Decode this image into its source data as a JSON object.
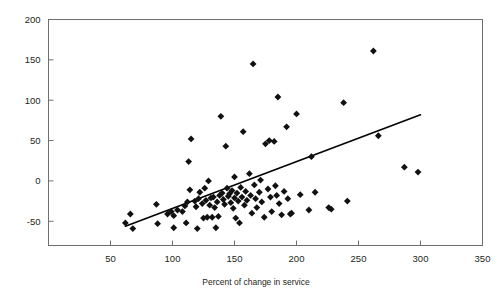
{
  "chart_data": {
    "type": "scatter",
    "title": "",
    "xlabel": "Percent of change in service",
    "ylabel": "",
    "xlim": [
      0,
      350
    ],
    "ylim": [
      -80,
      200
    ],
    "grid": false,
    "legend": "none",
    "x_ticks": [
      50,
      100,
      150,
      200,
      250,
      300,
      350
    ],
    "x_tick_labels": [
      "50",
      "100",
      "150",
      "200",
      "250",
      "300",
      "350"
    ],
    "y_ticks": [
      -50,
      0,
      50,
      100,
      150,
      200
    ],
    "y_tick_labels": [
      "-50",
      "0",
      "50",
      "100",
      "150",
      "200"
    ],
    "marker": "diamond",
    "marker_color": "#111111",
    "trendline": {
      "visible": true,
      "color": "#000000",
      "x_start": 62,
      "y_start": -56,
      "x_end": 300,
      "y_end": 82
    },
    "points": [
      {
        "x": 62,
        "y": -52
      },
      {
        "x": 66,
        "y": -41
      },
      {
        "x": 68,
        "y": -59
      },
      {
        "x": 87,
        "y": -29
      },
      {
        "x": 88,
        "y": -53
      },
      {
        "x": 96,
        "y": -41
      },
      {
        "x": 99,
        "y": -38
      },
      {
        "x": 101,
        "y": -43
      },
      {
        "x": 101,
        "y": -58
      },
      {
        "x": 104,
        "y": -36
      },
      {
        "x": 108,
        "y": -38
      },
      {
        "x": 110,
        "y": -31
      },
      {
        "x": 111,
        "y": -52
      },
      {
        "x": 112,
        "y": -26
      },
      {
        "x": 113,
        "y": 24
      },
      {
        "x": 114,
        "y": -11
      },
      {
        "x": 115,
        "y": 52
      },
      {
        "x": 118,
        "y": -25
      },
      {
        "x": 119,
        "y": -32
      },
      {
        "x": 120,
        "y": -59
      },
      {
        "x": 121,
        "y": -22
      },
      {
        "x": 122,
        "y": -14
      },
      {
        "x": 124,
        "y": -28
      },
      {
        "x": 125,
        "y": -46
      },
      {
        "x": 126,
        "y": -9
      },
      {
        "x": 127,
        "y": -24
      },
      {
        "x": 128,
        "y": -45
      },
      {
        "x": 129,
        "y": 0
      },
      {
        "x": 130,
        "y": -30
      },
      {
        "x": 131,
        "y": -21
      },
      {
        "x": 132,
        "y": -45
      },
      {
        "x": 133,
        "y": -20
      },
      {
        "x": 134,
        "y": -33
      },
      {
        "x": 135,
        "y": -58
      },
      {
        "x": 136,
        "y": -26
      },
      {
        "x": 137,
        "y": -44
      },
      {
        "x": 138,
        "y": -18
      },
      {
        "x": 139,
        "y": 80
      },
      {
        "x": 140,
        "y": -15
      },
      {
        "x": 141,
        "y": -23
      },
      {
        "x": 142,
        "y": -29
      },
      {
        "x": 143,
        "y": 43
      },
      {
        "x": 144,
        "y": -9
      },
      {
        "x": 145,
        "y": -19
      },
      {
        "x": 146,
        "y": -16
      },
      {
        "x": 147,
        "y": -27
      },
      {
        "x": 148,
        "y": -12
      },
      {
        "x": 149,
        "y": -34
      },
      {
        "x": 150,
        "y": 5
      },
      {
        "x": 150,
        "y": -21
      },
      {
        "x": 151,
        "y": -46
      },
      {
        "x": 152,
        "y": -15
      },
      {
        "x": 153,
        "y": -25
      },
      {
        "x": 154,
        "y": -52
      },
      {
        "x": 155,
        "y": -8
      },
      {
        "x": 156,
        "y": -20
      },
      {
        "x": 157,
        "y": 61
      },
      {
        "x": 158,
        "y": -30
      },
      {
        "x": 159,
        "y": -13
      },
      {
        "x": 160,
        "y": -24
      },
      {
        "x": 162,
        "y": 9
      },
      {
        "x": 163,
        "y": -18
      },
      {
        "x": 164,
        "y": -40
      },
      {
        "x": 165,
        "y": 145
      },
      {
        "x": 166,
        "y": -5
      },
      {
        "x": 167,
        "y": -22
      },
      {
        "x": 168,
        "y": -33
      },
      {
        "x": 170,
        "y": -14
      },
      {
        "x": 171,
        "y": 1
      },
      {
        "x": 172,
        "y": -26
      },
      {
        "x": 174,
        "y": -45
      },
      {
        "x": 175,
        "y": 46
      },
      {
        "x": 177,
        "y": -10
      },
      {
        "x": 178,
        "y": 50
      },
      {
        "x": 179,
        "y": -20
      },
      {
        "x": 180,
        "y": -38
      },
      {
        "x": 182,
        "y": 49
      },
      {
        "x": 183,
        "y": -6
      },
      {
        "x": 184,
        "y": -18
      },
      {
        "x": 185,
        "y": 104
      },
      {
        "x": 186,
        "y": -28
      },
      {
        "x": 188,
        "y": -42
      },
      {
        "x": 190,
        "y": -13
      },
      {
        "x": 192,
        "y": 67
      },
      {
        "x": 193,
        "y": -22
      },
      {
        "x": 195,
        "y": -41
      },
      {
        "x": 196,
        "y": -40
      },
      {
        "x": 200,
        "y": 83
      },
      {
        "x": 203,
        "y": -17
      },
      {
        "x": 210,
        "y": -36
      },
      {
        "x": 212,
        "y": 30
      },
      {
        "x": 215,
        "y": -14
      },
      {
        "x": 226,
        "y": -33
      },
      {
        "x": 228,
        "y": -35
      },
      {
        "x": 238,
        "y": 97
      },
      {
        "x": 241,
        "y": -25
      },
      {
        "x": 262,
        "y": 161
      },
      {
        "x": 266,
        "y": 56
      },
      {
        "x": 287,
        "y": 17
      },
      {
        "x": 298,
        "y": 11
      }
    ]
  }
}
